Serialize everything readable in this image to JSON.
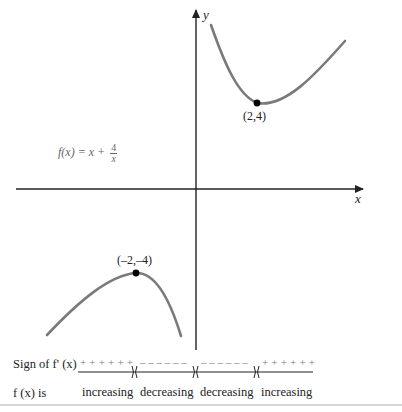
{
  "figure": {
    "function_label": {
      "lhs": "f(x) = x + ",
      "numerator": "4",
      "denominator": "x"
    },
    "axes": {
      "x_label": "x",
      "y_label": "y"
    },
    "points": [
      {
        "label": "(2,4)",
        "type": "local minimum"
      },
      {
        "label": "(–2,–4)",
        "type": "local maximum"
      }
    ],
    "colors": {
      "curve": "#7a7a7a",
      "axis": "#222222",
      "point": "#000000",
      "text": "#222222",
      "formula": "#666666"
    }
  },
  "sign_chart": {
    "row1_label": "Sign of f' (x)",
    "segments": [
      "+ + + + + +",
      "– – – – – –",
      "– – – – – –",
      "+ + + + + +"
    ],
    "row2_label": "f (x) is",
    "behavior": [
      "increasing",
      "decreasing",
      "decreasing",
      "increasing"
    ]
  }
}
